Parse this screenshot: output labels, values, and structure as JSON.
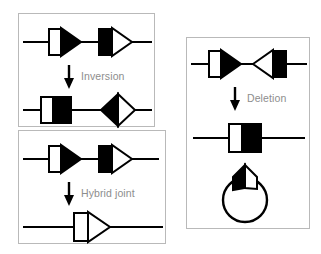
{
  "figure": {
    "background_color": "#ffffff",
    "stroke_color": "#000000",
    "fill_black": "#000000",
    "fill_white": "#ffffff",
    "panel_border_color": "#b9b9b9",
    "label_color": "#8d8d8d"
  },
  "panels": [
    {
      "id": "inversion",
      "operation_label": "Inversion",
      "arrow_icon": "down-arrow-icon",
      "before": {
        "segments": [
          {
            "name": "segment-white-box-black-arrow",
            "box_fill": "#ffffff",
            "arrow_fill": "#000000",
            "direction": "right"
          },
          {
            "name": "segment-black-box-white-arrow",
            "box_fill": "#000000",
            "arrow_fill": "#ffffff",
            "direction": "right"
          }
        ]
      },
      "after": {
        "segments": [
          {
            "name": "segment-white-box-black-box",
            "box_fill": "#ffffff",
            "arrow_fill": "#000000",
            "direction": "flat"
          },
          {
            "name": "segment-half-black-diamond",
            "box_fill": "#000000",
            "arrow_fill": "#ffffff",
            "direction": "diamond"
          }
        ]
      }
    },
    {
      "id": "hybrid",
      "operation_label": "Hybrid joint",
      "arrow_icon": "down-arrow-icon",
      "before": {
        "segments": [
          {
            "name": "segment-white-box-black-arrow",
            "box_fill": "#ffffff",
            "arrow_fill": "#000000",
            "direction": "right"
          },
          {
            "name": "segment-black-box-white-arrow",
            "box_fill": "#000000",
            "arrow_fill": "#ffffff",
            "direction": "right"
          }
        ]
      },
      "after": {
        "segments": [
          {
            "name": "segment-white-box-white-arrow",
            "box_fill": "#ffffff",
            "arrow_fill": "#ffffff",
            "direction": "right"
          }
        ]
      }
    },
    {
      "id": "deletion",
      "operation_label": "Deletion",
      "arrow_icon": "down-arrow-icon",
      "before": {
        "segments": [
          {
            "name": "segment-white-box-black-arrow",
            "box_fill": "#ffffff",
            "arrow_fill": "#000000",
            "direction": "right"
          },
          {
            "name": "segment-white-arrow-black-box",
            "box_fill": "#000000",
            "arrow_fill": "#ffffff",
            "direction": "left"
          }
        ]
      },
      "after": {
        "segments": [
          {
            "name": "segment-white-box-black-box",
            "box_fill": "#ffffff",
            "arrow_fill": "#000000",
            "direction": "flat"
          }
        ]
      },
      "excised": {
        "name": "circular-excision-product",
        "shape": "circle-with-half-black-diamond",
        "left_fill": "#000000",
        "right_fill": "#ffffff"
      }
    }
  ]
}
